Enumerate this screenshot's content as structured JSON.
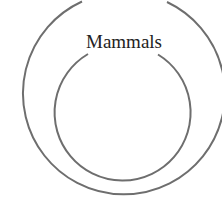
{
  "diagram": {
    "type": "nested-circles",
    "outer_circle": {
      "label": "Mammals",
      "cx": 120,
      "cy": 103,
      "r": 101,
      "gap": "top"
    },
    "inner_circle": {
      "label": "",
      "cx": 123,
      "cy": 115,
      "r": 68,
      "gap": "top"
    },
    "colors": {
      "stroke": "#6e6e6e",
      "text": "#222222",
      "background": "#ffffff"
    }
  }
}
